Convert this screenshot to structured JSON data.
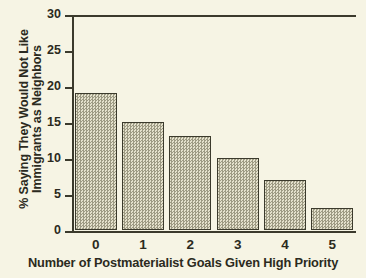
{
  "chart_data": {
    "type": "bar",
    "title": "",
    "categories": [
      "0",
      "1",
      "2",
      "3",
      "4",
      "5"
    ],
    "values": [
      19,
      15,
      13,
      10,
      7,
      3
    ],
    "series": [
      {
        "name": "% Saying They Would Not Like Immigrants as Neighbors",
        "values": [
          19,
          15,
          13,
          10,
          7,
          3
        ]
      }
    ],
    "xlabel": "Number of Postmaterialist Goals Given High Priority",
    "ylabel_line1": "% Saying They Would Not Like",
    "ylabel_line2": "Immigrants as Neighbors",
    "ylim": [
      0,
      30
    ],
    "yticks": [
      "0",
      "5",
      "10",
      "15",
      "20",
      "25",
      "30"
    ],
    "ytick_values": [
      0,
      5,
      10,
      15,
      20,
      25,
      30
    ],
    "grid": false,
    "legend": false,
    "legend_position": "none",
    "colors": {
      "background": "#f6f4e4",
      "axis": "#3b3a2c",
      "bar_fill": "#cdcab4",
      "bar_edge": "#3b3a2c",
      "text": "#2b2a20"
    }
  }
}
